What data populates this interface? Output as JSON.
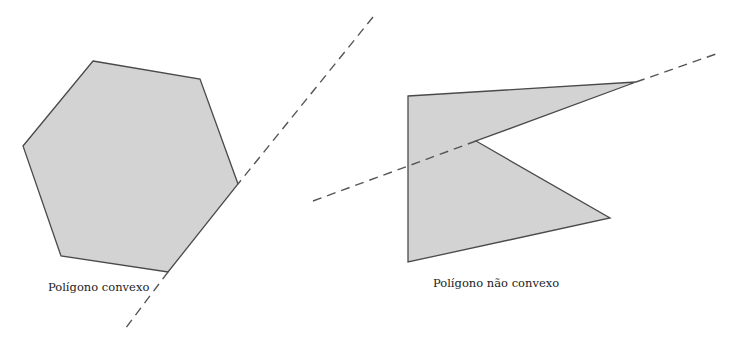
{
  "figure": {
    "panels": [
      {
        "id": "convex",
        "label": "Polígono convexo",
        "shape": "hexagon",
        "convex": true
      },
      {
        "id": "nonconvex",
        "label": "Polígono não convexo",
        "shape": "concave pentagon",
        "convex": false
      }
    ],
    "colors": {
      "fill": "#d3d3d3",
      "stroke": "#4a4a4a",
      "dashed_line": "#555555"
    }
  }
}
